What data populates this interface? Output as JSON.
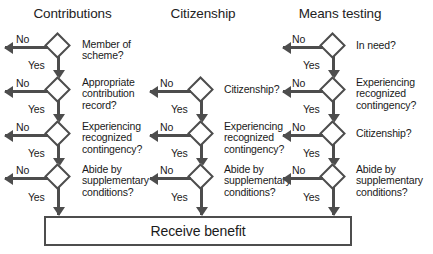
{
  "diagram": {
    "type": "flowchart",
    "colors": {
      "stroke": "#4d4d4d",
      "text": "#1a1a1a",
      "background": "#ffffff"
    },
    "labels": {
      "yes": "Yes",
      "no": "No"
    },
    "columns": [
      {
        "id": "contributions",
        "header": "Contributions",
        "nodes": [
          {
            "id": "c1",
            "text": "Member of\nscheme?",
            "row": 1
          },
          {
            "id": "c2",
            "text": "Appropriate\ncontribution\nrecord?",
            "row": 2
          },
          {
            "id": "c3",
            "text": "Experiencing\nrecognized\ncontingency?",
            "row": 3
          },
          {
            "id": "c4",
            "text": "Abide by\nsupplementary\nconditions?",
            "row": 4
          }
        ]
      },
      {
        "id": "citizenship",
        "header": "Citizenship",
        "nodes": [
          {
            "id": "z2",
            "text": "Citizenship?",
            "row": 2
          },
          {
            "id": "z3",
            "text": "Experiencing\nrecognized\ncontingency?",
            "row": 3
          },
          {
            "id": "z4",
            "text": "Abide by\nsupplementary\nconditions?",
            "row": 4
          }
        ]
      },
      {
        "id": "means-testing",
        "header": "Means testing",
        "nodes": [
          {
            "id": "m1",
            "text": "In need?",
            "row": 1
          },
          {
            "id": "m2",
            "text": "Experiencing\nrecognized\ncontingency?",
            "row": 2
          },
          {
            "id": "m3",
            "text": "Citizenship?",
            "row": 3
          },
          {
            "id": "m4",
            "text": "Abide by\nsupplementary\nconditions?",
            "row": 4
          }
        ]
      }
    ],
    "terminal": {
      "id": "receive-benefit",
      "text": "Receive benefit"
    }
  }
}
